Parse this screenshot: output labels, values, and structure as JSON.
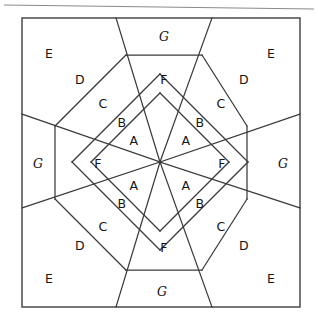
{
  "figure": {
    "background_color": "#ffffff",
    "line_color": "#3a3a3a",
    "frame_color": "#555555",
    "rule_color": "#8a8a8a",
    "text_color": "#151515"
  },
  "geometry": {
    "center": {
      "x": 160,
      "y": 162
    },
    "frame": {
      "left": 22,
      "top": 18,
      "right": 300,
      "bottom": 307
    },
    "top_rule": {
      "x1": 4,
      "y1": 5,
      "x2": 314,
      "y2": 9
    },
    "border_nodes": {
      "top_left_x": 116,
      "top_right_x": 212,
      "bottom_left_x": 116,
      "bottom_right_x": 212,
      "left_top_y": 114,
      "left_bottom_y": 208,
      "right_top_y": 114,
      "right_bottom_y": 208
    },
    "inner_octagon": {
      "top_left": {
        "x": 126,
        "y": 55
      },
      "top_right": {
        "x": 202,
        "y": 55
      },
      "right_top": {
        "x": 247,
        "y": 126
      },
      "right_bottom": {
        "x": 247,
        "y": 199
      },
      "bottom_right": {
        "x": 202,
        "y": 270
      },
      "bottom_left": {
        "x": 126,
        "y": 270
      },
      "left_bottom": {
        "x": 55,
        "y": 199
      },
      "left_top": {
        "x": 55,
        "y": 126
      }
    }
  },
  "labels": [
    {
      "id": "a-ne",
      "text": "A",
      "x": 186,
      "y": 140,
      "style": "plain"
    },
    {
      "id": "a-nw",
      "text": "A",
      "x": 134,
      "y": 140,
      "style": "plain"
    },
    {
      "id": "a-se",
      "text": "A",
      "x": 186,
      "y": 185,
      "style": "plain"
    },
    {
      "id": "a-sw",
      "text": "A",
      "x": 134,
      "y": 185,
      "style": "plain"
    },
    {
      "id": "b-ne",
      "text": "B",
      "x": 200,
      "y": 122,
      "style": "plain"
    },
    {
      "id": "b-nw",
      "text": "B",
      "x": 122,
      "y": 122,
      "style": "plain"
    },
    {
      "id": "b-se",
      "text": "B",
      "x": 200,
      "y": 203,
      "style": "plain"
    },
    {
      "id": "b-sw",
      "text": "B",
      "x": 122,
      "y": 203,
      "style": "plain"
    },
    {
      "id": "c-ne",
      "text": "C",
      "x": 221,
      "y": 103,
      "style": "plain"
    },
    {
      "id": "c-nw",
      "text": "C",
      "x": 103,
      "y": 103,
      "style": "plain"
    },
    {
      "id": "c-se",
      "text": "C",
      "x": 221,
      "y": 226,
      "style": "plain"
    },
    {
      "id": "c-sw",
      "text": "C",
      "x": 103,
      "y": 226,
      "style": "plain"
    },
    {
      "id": "d-ne",
      "text": "D",
      "x": 244,
      "y": 79,
      "style": "plain"
    },
    {
      "id": "d-nw",
      "text": "D",
      "x": 80,
      "y": 79,
      "style": "plain"
    },
    {
      "id": "d-se",
      "text": "D",
      "x": 244,
      "y": 245,
      "style": "plain"
    },
    {
      "id": "d-sw",
      "text": "D",
      "x": 80,
      "y": 245,
      "style": "plain"
    },
    {
      "id": "e-ne",
      "text": "E",
      "x": 271,
      "y": 53,
      "style": "plain"
    },
    {
      "id": "e-nw",
      "text": "E",
      "x": 49,
      "y": 53,
      "style": "plain"
    },
    {
      "id": "e-se",
      "text": "E",
      "x": 271,
      "y": 278,
      "style": "plain"
    },
    {
      "id": "e-sw",
      "text": "E",
      "x": 49,
      "y": 278,
      "style": "plain"
    },
    {
      "id": "f-n",
      "text": "F",
      "x": 164,
      "y": 79,
      "style": "plain"
    },
    {
      "id": "f-s",
      "text": "F",
      "x": 164,
      "y": 247,
      "style": "plain"
    },
    {
      "id": "f-w",
      "text": "F",
      "x": 98,
      "y": 163,
      "style": "plain"
    },
    {
      "id": "f-e",
      "text": "F",
      "x": 222,
      "y": 163,
      "style": "plain"
    },
    {
      "id": "g-n",
      "text": "G",
      "x": 164,
      "y": 36,
      "style": "italic"
    },
    {
      "id": "g-s",
      "text": "G",
      "x": 162,
      "y": 291,
      "style": "italic"
    },
    {
      "id": "g-w",
      "text": "G",
      "x": 38,
      "y": 163,
      "style": "italic"
    },
    {
      "id": "g-e",
      "text": "G",
      "x": 283,
      "y": 163,
      "style": "italic"
    }
  ],
  "cut_lines": [
    {
      "id": "spoke-ne",
      "x1": 160,
      "y1": 162,
      "x2": 212,
      "y2": 18
    },
    {
      "id": "spoke-nw",
      "x1": 160,
      "y1": 162,
      "x2": 116,
      "y2": 18
    },
    {
      "id": "spoke-se",
      "x1": 160,
      "y1": 162,
      "x2": 212,
      "y2": 307
    },
    {
      "id": "spoke-sw",
      "x1": 160,
      "y1": 162,
      "x2": 116,
      "y2": 307
    },
    {
      "id": "spoke-e",
      "x1": 160,
      "y1": 162,
      "x2": 300,
      "y2": 114
    },
    {
      "id": "spoke-e2",
      "x1": 160,
      "y1": 162,
      "x2": 300,
      "y2": 208
    },
    {
      "id": "spoke-w",
      "x1": 160,
      "y1": 162,
      "x2": 22,
      "y2": 114
    },
    {
      "id": "spoke-w2",
      "x1": 160,
      "y1": 162,
      "x2": 22,
      "y2": 208
    },
    {
      "id": "oct-top",
      "x1": 126,
      "y1": 55,
      "x2": 202,
      "y2": 55
    },
    {
      "id": "oct-bottom",
      "x1": 126,
      "y1": 270,
      "x2": 202,
      "y2": 270
    },
    {
      "id": "oct-left",
      "x1": 55,
      "y1": 126,
      "x2": 55,
      "y2": 199
    },
    {
      "id": "oct-right",
      "x1": 247,
      "y1": 126,
      "x2": 247,
      "y2": 199
    },
    {
      "id": "oct-nw-diag",
      "x1": 55,
      "y1": 126,
      "x2": 126,
      "y2": 55
    },
    {
      "id": "oct-ne-diag",
      "x1": 202,
      "y1": 55,
      "x2": 247,
      "y2": 126
    },
    {
      "id": "oct-sw-diag",
      "x1": 55,
      "y1": 199,
      "x2": 126,
      "y2": 270
    },
    {
      "id": "oct-se-diag",
      "x1": 202,
      "y1": 270,
      "x2": 247,
      "y2": 199
    },
    {
      "id": "strip-nw-1",
      "x1": 91,
      "y1": 162,
      "x2": 160,
      "y2": 93
    },
    {
      "id": "strip-nw-2",
      "x1": 72,
      "y1": 162,
      "x2": 160,
      "y2": 74
    },
    {
      "id": "strip-ne-1",
      "x1": 229,
      "y1": 162,
      "x2": 160,
      "y2": 93
    },
    {
      "id": "strip-ne-2",
      "x1": 248,
      "y1": 162,
      "x2": 160,
      "y2": 74
    },
    {
      "id": "strip-sw-1",
      "x1": 91,
      "y1": 162,
      "x2": 160,
      "y2": 231
    },
    {
      "id": "strip-sw-2",
      "x1": 72,
      "y1": 162,
      "x2": 160,
      "y2": 250
    },
    {
      "id": "strip-se-1",
      "x1": 229,
      "y1": 162,
      "x2": 160,
      "y2": 231
    },
    {
      "id": "strip-se-2",
      "x1": 248,
      "y1": 162,
      "x2": 160,
      "y2": 250
    }
  ]
}
